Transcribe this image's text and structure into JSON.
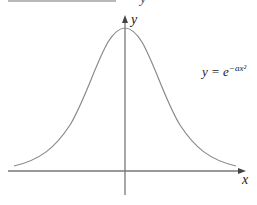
{
  "figure": {
    "top_fragment_glyph": "y",
    "y_axis_label": "y",
    "x_axis_label": "x",
    "equation": {
      "lhs": "y = e",
      "exponent": "−ax²"
    }
  },
  "colors": {
    "curve": "#8a8a8a",
    "axes": "#777777",
    "text": "#222222"
  }
}
